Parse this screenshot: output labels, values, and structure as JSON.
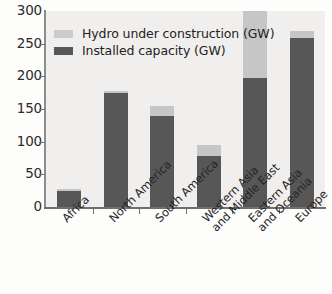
{
  "chart_data": {
    "type": "bar",
    "subtype": "stacked-vertical",
    "title": "",
    "xlabel": "",
    "ylabel": "",
    "ylim": [
      0,
      300
    ],
    "yticks": [
      0,
      50,
      100,
      150,
      200,
      250,
      300
    ],
    "grid": false,
    "legend_position": "upper-left-inside",
    "categories": [
      "Africa",
      "North America",
      "South America",
      "Western Asia and Middle East",
      "Eastern Asia and Oceania",
      "Europe"
    ],
    "category_lines": [
      [
        "Africa",
        ""
      ],
      [
        "North America",
        ""
      ],
      [
        "South America",
        ""
      ],
      [
        "Western Asia",
        "and Middle East"
      ],
      [
        "Eastern Asia",
        "and Oceania"
      ],
      [
        "Europe",
        ""
      ]
    ],
    "series": [
      {
        "name": "Installed capacity (GW)",
        "color": "#575757",
        "values": [
          25,
          175,
          139,
          78,
          198,
          258
        ]
      },
      {
        "name": "Hydro under construction (GW)",
        "color": "#c6c6c6",
        "values": [
          2,
          3,
          16,
          17,
          102,
          12
        ]
      }
    ],
    "totals": [
      27,
      178,
      155,
      95,
      300,
      270
    ]
  },
  "legend": {
    "entries": [
      {
        "label": "Hydro under construction (GW)",
        "swatch": "light"
      },
      {
        "label": "Installed capacity (GW)",
        "swatch": "dark"
      }
    ]
  },
  "axis": {
    "y_tick_labels": [
      "300",
      "250",
      "200",
      "150",
      "100",
      "50",
      "0"
    ]
  },
  "colors": {
    "installed": "#575757",
    "under_construction": "#c6c6c6",
    "plot_background": "#f1efed",
    "axis": "#6f6f6f",
    "text": "#222222"
  }
}
